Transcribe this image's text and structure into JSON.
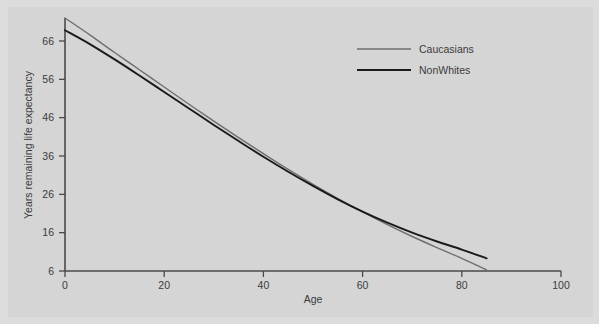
{
  "figure": {
    "background_color": "#d5d5d5",
    "frame_color": "#dcdcdc",
    "axis_color": "#4a4a4a",
    "text_color": "#3b3b3b"
  },
  "legend": {
    "position": "top-right",
    "entries": [
      {
        "label": "Caucasians",
        "color": "#6e6e6e"
      },
      {
        "label": "NonWhites",
        "color": "#1a1a1a"
      }
    ]
  },
  "chart_data": {
    "type": "line",
    "title": "",
    "xlabel": "Age",
    "ylabel": "Years remaining life expectancy",
    "xlim": [
      0,
      100
    ],
    "ylim": [
      6,
      72
    ],
    "xticks": [
      0,
      20,
      40,
      60,
      80,
      100
    ],
    "xticklabels": [
      "0",
      "20",
      "40",
      "60",
      "80",
      "100"
    ],
    "yticks": [
      6,
      16,
      26,
      36,
      46,
      56,
      66
    ],
    "yticklabels": [
      "6",
      "16",
      "26",
      "36",
      "46",
      "56",
      "66"
    ],
    "grid": false,
    "legend_position": "top-right",
    "x": [
      0,
      5,
      10,
      15,
      20,
      25,
      30,
      35,
      40,
      45,
      50,
      55,
      60,
      65,
      70,
      75,
      80,
      85
    ],
    "series": [
      {
        "name": "Caucasians",
        "color": "#6e6e6e",
        "linewidth": 1.4,
        "values": [
          72.0,
          67.6,
          63.0,
          58.5,
          54.0,
          49.5,
          45.1,
          40.8,
          36.6,
          32.5,
          28.6,
          24.9,
          21.4,
          18.1,
          15.0,
          12.1,
          9.3,
          6.3
        ]
      },
      {
        "name": "NonWhites",
        "color": "#1a1a1a",
        "linewidth": 1.9,
        "values": [
          68.8,
          65.2,
          61.2,
          57.0,
          52.7,
          48.4,
          44.1,
          39.9,
          35.8,
          31.9,
          28.2,
          24.7,
          21.5,
          18.6,
          16.0,
          13.7,
          11.6,
          9.3
        ]
      }
    ],
    "annotations": [
      "Caucasians and NonWhites curves cross near age 67 at about 17 years remaining"
    ]
  }
}
